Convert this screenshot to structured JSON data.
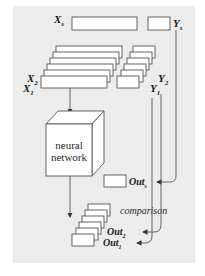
{
  "diagram": {
    "labels": {
      "xs": "X",
      "xs_sub": "s",
      "ys": "Y",
      "ys_sub": "s",
      "x2": "X",
      "x2_sub": "2",
      "x1": "X",
      "x1_sub": "1",
      "y2": "Y",
      "y2_sub": "2",
      "y1": "Y",
      "y1_sub": "1",
      "nn_line1": "neural",
      "nn_line2": "network",
      "outs": "Out",
      "outs_sub": "s",
      "out2": "Out",
      "out2_sub": "2",
      "out1": "Out",
      "out1_sub": "1",
      "comparison": "comparison"
    },
    "colors": {
      "panel": "#ececec",
      "box_fill": "#ffffff",
      "stroke": "#555555",
      "text": "#1a1a1a"
    }
  }
}
